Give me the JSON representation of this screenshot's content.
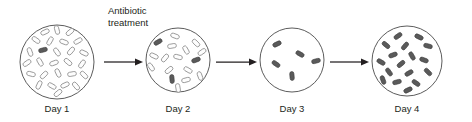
{
  "diagram": {
    "type": "process-flow",
    "annotation": {
      "line1": "Antibiotic",
      "line2": "treatment",
      "x": 108,
      "y": 14
    },
    "colors": {
      "dish_stroke": "#4a4a4a",
      "cell_light_fill": "#fdfdfd",
      "cell_light_stroke": "#8d8d8d",
      "cell_dark_fill": "#5a5a5a",
      "cell_dark_stroke": "#3d3d3d",
      "text": "#231f20",
      "arrow": "#231f20",
      "background": "#ffffff"
    },
    "stages": [
      {
        "id": "day-1",
        "label": "Day 1",
        "label_x": 57,
        "label_y": 112,
        "dish": {
          "cx": 57,
          "cy": 62,
          "r": 37
        },
        "susceptible_count": 26,
        "resistant_count": 1,
        "cells": [
          {
            "x": 45,
            "y": 32,
            "rot": -25,
            "type": "light"
          },
          {
            "x": 57,
            "y": 30,
            "rot": 75,
            "type": "light"
          },
          {
            "x": 70,
            "y": 32,
            "rot": -40,
            "type": "light"
          },
          {
            "x": 36,
            "y": 40,
            "rot": 35,
            "type": "light"
          },
          {
            "x": 50,
            "y": 41,
            "rot": -60,
            "type": "light"
          },
          {
            "x": 64,
            "y": 42,
            "rot": 20,
            "type": "light"
          },
          {
            "x": 78,
            "y": 41,
            "rot": -30,
            "type": "light"
          },
          {
            "x": 30,
            "y": 52,
            "rot": 70,
            "type": "light"
          },
          {
            "x": 43,
            "y": 50,
            "rot": -15,
            "type": "dark"
          },
          {
            "x": 57,
            "y": 52,
            "rot": 55,
            "type": "light"
          },
          {
            "x": 71,
            "y": 51,
            "rot": -50,
            "type": "light"
          },
          {
            "x": 84,
            "y": 53,
            "rot": 25,
            "type": "light"
          },
          {
            "x": 27,
            "y": 63,
            "rot": -35,
            "type": "light"
          },
          {
            "x": 40,
            "y": 62,
            "rot": 60,
            "type": "light"
          },
          {
            "x": 54,
            "y": 63,
            "rot": -20,
            "type": "light"
          },
          {
            "x": 68,
            "y": 62,
            "rot": 40,
            "type": "light"
          },
          {
            "x": 82,
            "y": 64,
            "rot": -55,
            "type": "light"
          },
          {
            "x": 31,
            "y": 74,
            "rot": 15,
            "type": "light"
          },
          {
            "x": 44,
            "y": 75,
            "rot": -45,
            "type": "light"
          },
          {
            "x": 58,
            "y": 73,
            "rot": 65,
            "type": "light"
          },
          {
            "x": 72,
            "y": 74,
            "rot": -10,
            "type": "light"
          },
          {
            "x": 84,
            "y": 75,
            "rot": 45,
            "type": "light"
          },
          {
            "x": 39,
            "y": 85,
            "rot": -65,
            "type": "light"
          },
          {
            "x": 52,
            "y": 86,
            "rot": 30,
            "type": "light"
          },
          {
            "x": 65,
            "y": 85,
            "rot": -25,
            "type": "light"
          },
          {
            "x": 76,
            "y": 86,
            "rot": 50,
            "type": "light"
          },
          {
            "x": 58,
            "y": 93,
            "rot": -40,
            "type": "light"
          }
        ]
      },
      {
        "id": "day-2",
        "label": "Day 2",
        "label_x": 178,
        "label_y": 112,
        "dish": {
          "cx": 178,
          "cy": 60,
          "r": 32
        },
        "susceptible_count": 13,
        "resistant_count": 3,
        "cells": [
          {
            "x": 175,
            "y": 36,
            "rot": 20,
            "type": "light"
          },
          {
            "x": 158,
            "y": 42,
            "rot": -30,
            "type": "dark"
          },
          {
            "x": 196,
            "y": 43,
            "rot": 45,
            "type": "light"
          },
          {
            "x": 172,
            "y": 46,
            "rot": -10,
            "type": "light"
          },
          {
            "x": 186,
            "y": 50,
            "rot": 60,
            "type": "light"
          },
          {
            "x": 202,
            "y": 52,
            "rot": -35,
            "type": "light"
          },
          {
            "x": 154,
            "y": 56,
            "rot": 25,
            "type": "light"
          },
          {
            "x": 165,
            "y": 58,
            "rot": -50,
            "type": "light"
          },
          {
            "x": 178,
            "y": 57,
            "rot": 15,
            "type": "light"
          },
          {
            "x": 196,
            "y": 60,
            "rot": -20,
            "type": "dark"
          },
          {
            "x": 151,
            "y": 67,
            "rot": 55,
            "type": "light"
          },
          {
            "x": 169,
            "y": 70,
            "rot": -40,
            "type": "light"
          },
          {
            "x": 188,
            "y": 70,
            "rot": 30,
            "type": "light"
          },
          {
            "x": 172,
            "y": 79,
            "rot": 85,
            "type": "dark"
          },
          {
            "x": 186,
            "y": 80,
            "rot": -15,
            "type": "light"
          },
          {
            "x": 200,
            "y": 76,
            "rot": 70,
            "type": "light"
          },
          {
            "x": 178,
            "y": 88,
            "rot": 80,
            "type": "light"
          }
        ]
      },
      {
        "id": "day-3",
        "label": "Day 3",
        "label_x": 292,
        "label_y": 112,
        "dish": {
          "cx": 292,
          "cy": 60,
          "r": 32
        },
        "susceptible_count": 0,
        "resistant_count": 5,
        "cells": [
          {
            "x": 277,
            "y": 44,
            "rot": -25,
            "type": "dark"
          },
          {
            "x": 300,
            "y": 54,
            "rot": 30,
            "type": "dark"
          },
          {
            "x": 316,
            "y": 61,
            "rot": -15,
            "type": "dark"
          },
          {
            "x": 276,
            "y": 64,
            "rot": 35,
            "type": "dark"
          },
          {
            "x": 292,
            "y": 76,
            "rot": 85,
            "type": "dark"
          }
        ]
      },
      {
        "id": "day-4",
        "label": "Day 4",
        "label_x": 407,
        "label_y": 112,
        "dish": {
          "cx": 407,
          "cy": 61,
          "r": 35
        },
        "susceptible_count": 0,
        "resistant_count": 17,
        "cells": [
          {
            "x": 398,
            "y": 36,
            "rot": -35,
            "type": "dark"
          },
          {
            "x": 419,
            "y": 37,
            "rot": 25,
            "type": "dark"
          },
          {
            "x": 386,
            "y": 45,
            "rot": 40,
            "type": "dark"
          },
          {
            "x": 405,
            "y": 46,
            "rot": -50,
            "type": "dark"
          },
          {
            "x": 428,
            "y": 46,
            "rot": 15,
            "type": "dark"
          },
          {
            "x": 393,
            "y": 55,
            "rot": -20,
            "type": "dark"
          },
          {
            "x": 412,
            "y": 56,
            "rot": 60,
            "type": "dark"
          },
          {
            "x": 381,
            "y": 62,
            "rot": 30,
            "type": "dark"
          },
          {
            "x": 401,
            "y": 64,
            "rot": -40,
            "type": "dark"
          },
          {
            "x": 424,
            "y": 60,
            "rot": 20,
            "type": "dark"
          },
          {
            "x": 389,
            "y": 72,
            "rot": 55,
            "type": "dark"
          },
          {
            "x": 409,
            "y": 73,
            "rot": -30,
            "type": "dark"
          },
          {
            "x": 428,
            "y": 72,
            "rot": 45,
            "type": "dark"
          },
          {
            "x": 397,
            "y": 82,
            "rot": -15,
            "type": "dark"
          },
          {
            "x": 416,
            "y": 83,
            "rot": 35,
            "type": "dark"
          },
          {
            "x": 383,
            "y": 80,
            "rot": 70,
            "type": "dark"
          },
          {
            "x": 408,
            "y": 90,
            "rot": -25,
            "type": "dark"
          }
        ]
      }
    ],
    "arrows": [
      {
        "id": "arrow-day1-day2",
        "x1": 104,
        "x2": 142,
        "y": 62
      },
      {
        "id": "arrow-day2-day3",
        "x1": 216,
        "x2": 256,
        "y": 62
      },
      {
        "id": "arrow-day3-day4",
        "x1": 330,
        "x2": 368,
        "y": 62
      }
    ]
  }
}
